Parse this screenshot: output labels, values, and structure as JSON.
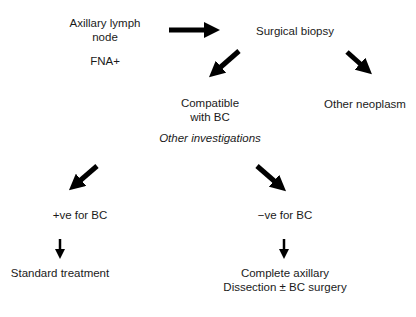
{
  "nodes": {
    "axillary": "Axillary lymph",
    "axillary_2": "node",
    "fna": "FNA+",
    "surgical_biopsy": "Surgical biopsy",
    "compatible": "Compatible",
    "compatible_2": "with BC",
    "other_neoplasm": "Other neoplasm",
    "other_investigations": "Other investigations",
    "positive": "+ve for BC",
    "negative": "−ve for BC",
    "standard_treatment": "Standard treatment",
    "complete_axillary": "Complete axillary",
    "complete_axillary_2": "Dissection ± BC surgery"
  },
  "colors": {
    "arrow": "#000000",
    "text": "#1a1a1a",
    "background": "#ffffff"
  }
}
